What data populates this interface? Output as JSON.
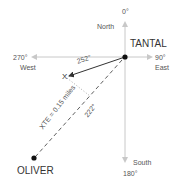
{
  "compass": {
    "north_degrees": "0°",
    "north_label": "North",
    "east_degrees": "90°",
    "east_label": "East",
    "south_degrees": "180°",
    "south_label": "South",
    "west_degrees": "270°",
    "west_label": "West"
  },
  "waypoints": {
    "origin": "TANTAL",
    "destination": "OLIVER",
    "current_position": "X"
  },
  "annotations": {
    "actual_bearing": "252°",
    "intended_bearing": "222°",
    "cross_track_error": "XTE = 0.15 miles"
  },
  "colors": {
    "axis": "#c8c8c8",
    "course_line": "#333333",
    "text": "#555555",
    "dot": "#111111"
  }
}
